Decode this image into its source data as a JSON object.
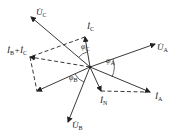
{
  "diagram": {
    "colors": {
      "line": "#222222",
      "background": "#ffffff"
    },
    "origin": [
      90,
      67
    ],
    "vectors": [
      {
        "id": "UA",
        "label": "U̇",
        "sub": "A",
        "tip": [
          155,
          44
        ],
        "style": "solid",
        "label_pos": [
          157,
          50
        ]
      },
      {
        "id": "UC",
        "label": "U̇",
        "sub": "C",
        "tip": [
          31,
          17
        ],
        "style": "solid",
        "label_pos": [
          36,
          15
        ]
      },
      {
        "id": "UB",
        "label": "U̇",
        "sub": "B",
        "tip": [
          68,
          122
        ],
        "style": "solid",
        "label_pos": [
          72,
          128
        ]
      },
      {
        "id": "IC",
        "label": "İ",
        "sub": "C",
        "tip": [
          85,
          37
        ],
        "style": "solid",
        "label_pos": [
          87,
          29
        ]
      },
      {
        "id": "IA",
        "label": "İ",
        "sub": "A",
        "tip": [
          150,
          92
        ],
        "style": "solid",
        "label_pos": [
          155,
          99
        ]
      },
      {
        "id": "IN",
        "label": "İ",
        "sub": "N",
        "tip": [
          101,
          91
        ],
        "style": "solid",
        "label_pos": [
          100,
          103
        ]
      },
      {
        "id": "IB",
        "label": "",
        "sub": "",
        "tip": [
          37,
          91
        ],
        "style": "solid",
        "label_pos": null
      },
      {
        "id": "IBC",
        "label": "İ",
        "sub": "B",
        "tip": [
          30,
          57
        ],
        "style": "dashed",
        "label_pos": [
          8,
          52
        ]
      }
    ],
    "sum_label": {
      "text": "İ",
      "sub1": "B",
      "plus": "+",
      "text2": "İ",
      "sub2": "C"
    },
    "dashed_lines": [
      {
        "from": [
          85,
          37
        ],
        "to": [
          30,
          57
        ]
      },
      {
        "from": [
          30,
          57
        ],
        "to": [
          37,
          91
        ]
      },
      {
        "from": [
          101,
          91
        ],
        "to": [
          150,
          92
        ]
      }
    ],
    "angles": [
      {
        "label": "φ",
        "sub": "A",
        "pos": [
          106,
          63
        ]
      },
      {
        "label": "φ",
        "sub": "C",
        "pos": [
          81,
          49
        ]
      },
      {
        "label": "φ",
        "sub": "B",
        "pos": [
          69,
          80
        ]
      }
    ]
  }
}
